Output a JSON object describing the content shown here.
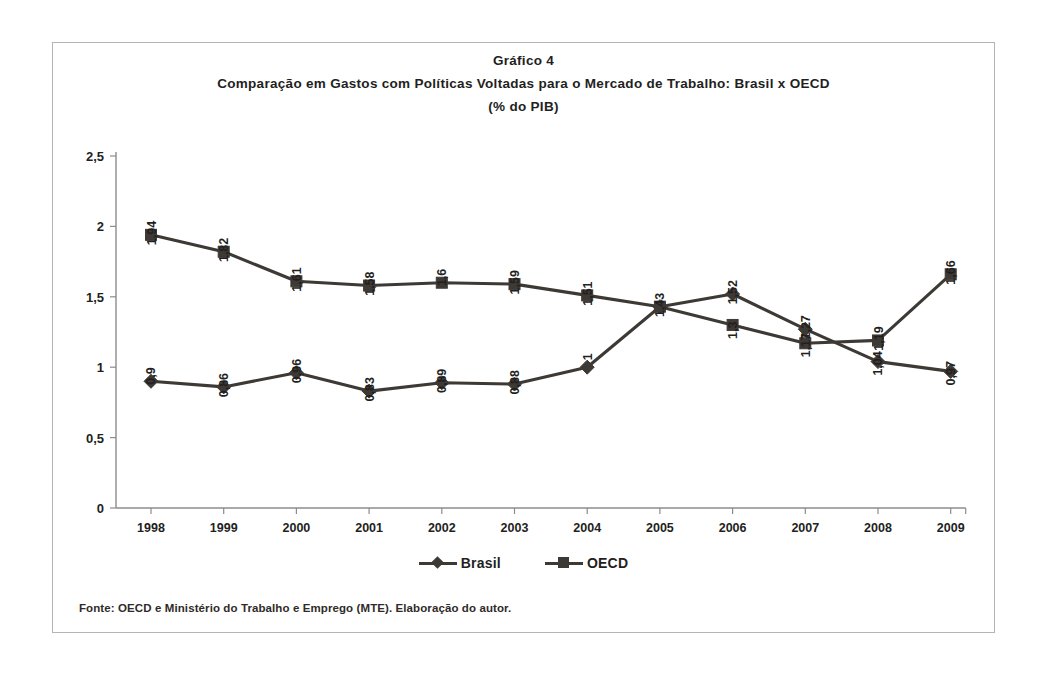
{
  "figure": {
    "title_line1": "Gráfico 4",
    "title_line2": "Comparação em Gastos com Políticas Voltadas para o Mercado de Trabalho: Brasil x OECD",
    "title_line3": "(% do PIB)",
    "source_note": "Fonte: OECD e Ministério do Trabalho e Emprego (MTE). Elaboração do autor."
  },
  "legend": {
    "brasil_label": "Brasil",
    "oecd_label": "OECD",
    "brasil_marker": "diamond",
    "oecd_marker": "square"
  },
  "colors": {
    "series": "#3d3935",
    "axis": "#8c8c8c",
    "text": "#231f1e",
    "frame": "#b4b4b4",
    "background": "#ffffff"
  },
  "chart_data": {
    "type": "line",
    "title": "Comparação em Gastos com Políticas Voltadas para o Mercado de Trabalho: Brasil x OECD (% do PIB)",
    "xlabel": "",
    "ylabel": "",
    "ylim": [
      0,
      2.5
    ],
    "ytick_labels": [
      "0",
      "0,5",
      "1",
      "1,5",
      "2",
      "2,5"
    ],
    "ytick_values": [
      0,
      0.5,
      1,
      1.5,
      2,
      2.5
    ],
    "grid": false,
    "legend_position": "bottom",
    "categories": [
      "1998",
      "1999",
      "2000",
      "2001",
      "2002",
      "2003",
      "2004",
      "2005",
      "2006",
      "2007",
      "2008",
      "2009"
    ],
    "series": [
      {
        "name": "Brasil",
        "marker": "diamond",
        "values": [
          0.9,
          0.86,
          0.96,
          0.83,
          0.89,
          0.88,
          1.0,
          1.43,
          1.52,
          1.27,
          1.04,
          0.97
        ],
        "labels": [
          "0,9",
          "0,86",
          "0,96",
          "0,83",
          "0,89",
          "0,88",
          "1",
          "1,43",
          "1,52",
          "1,27",
          "1,04",
          "0,97"
        ],
        "label_positions": [
          "above",
          "above",
          "above",
          "above",
          "above",
          "above",
          "above",
          "hidden",
          "above",
          "above",
          "below",
          "below"
        ]
      },
      {
        "name": "OECD",
        "marker": "square",
        "values": [
          1.94,
          1.82,
          1.61,
          1.58,
          1.6,
          1.59,
          1.51,
          1.43,
          1.3,
          1.17,
          1.19,
          1.66
        ],
        "labels": [
          "1,94",
          "1,82",
          "1,61",
          "1,58",
          "1,6",
          "1,59",
          "1,51",
          "1,43",
          "1,3",
          "1,17",
          "1,19",
          "1,66"
        ],
        "label_positions": [
          "above",
          "above",
          "above",
          "above",
          "above",
          "above",
          "above",
          "above",
          "below",
          "below",
          "above",
          "above"
        ]
      }
    ]
  }
}
